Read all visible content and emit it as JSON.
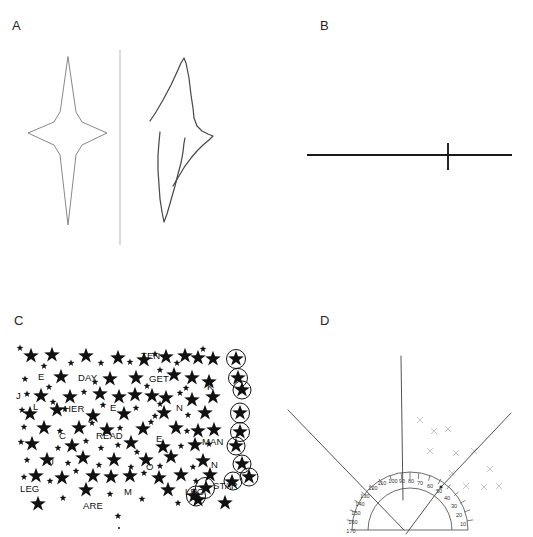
{
  "figure": {
    "background_color": "#ffffff",
    "ink_color": "#1a1a1a",
    "faint_ink_color": "#b9b9b9"
  },
  "panels": {
    "a": {
      "label": "A",
      "name": "figure-copying-task",
      "description": "Star figure copying task: model star at left of a vertical divider, patient copy at right with left side omitted",
      "divider": {
        "x": 120,
        "y_top": 50,
        "y_bottom": 245
      },
      "model_star": {
        "points": [
          [
            68,
            57
          ],
          [
            76,
            112
          ],
          [
            82,
            122
          ],
          [
            107,
            133
          ],
          [
            82,
            145
          ],
          [
            76,
            155
          ],
          [
            68,
            225
          ],
          [
            60,
            155
          ],
          [
            54,
            145
          ],
          [
            28,
            133
          ],
          [
            54,
            122
          ],
          [
            60,
            112
          ]
        ]
      },
      "copy_star": {
        "upper_stroke": [
          [
            150,
            121
          ],
          [
            156,
            112
          ],
          [
            163,
            100
          ],
          [
            171,
            85
          ],
          [
            177,
            72
          ],
          [
            181,
            63
          ],
          [
            184,
            58
          ],
          [
            186,
            63
          ],
          [
            189,
            78
          ],
          [
            191,
            95
          ],
          [
            193,
            108
          ],
          [
            194,
            118
          ],
          [
            197,
            126
          ],
          [
            202,
            131
          ],
          [
            208,
            134
          ],
          [
            213,
            136
          ],
          [
            209,
            140
          ],
          [
            203,
            145
          ],
          [
            197,
            151
          ],
          [
            191,
            158
          ],
          [
            185,
            166
          ],
          [
            179,
            176
          ],
          [
            173,
            186
          ]
        ],
        "lower_stroke": [
          [
            160,
            132
          ],
          [
            159,
            142
          ],
          [
            158,
            155
          ],
          [
            158,
            170
          ],
          [
            159,
            185
          ],
          [
            160,
            199
          ],
          [
            162,
            212
          ],
          [
            164,
            222
          ],
          [
            167,
            214
          ],
          [
            171,
            200
          ],
          [
            175,
            186
          ],
          [
            178,
            174
          ],
          [
            181,
            163
          ],
          [
            183,
            152
          ],
          [
            184,
            143
          ],
          [
            185,
            138
          ]
        ]
      }
    },
    "b": {
      "label": "B",
      "name": "line-bisection-task",
      "description": "Line bisection task: horizontal line with the patient's bisection mark displaced to the right of true midpoint",
      "line": {
        "x_start": 307,
        "x_end": 512,
        "y": 155
      },
      "true_midpoint_x": 409.5,
      "bisection_mark": {
        "x": 448,
        "y_top": 143,
        "y_bottom": 170
      }
    },
    "c": {
      "label": "C",
      "name": "star-cancellation-task",
      "description": "Star cancellation test: field of large and small stars interspersed with letters and words; the patient has circled only targets on the right side of the page",
      "words": [
        {
          "text": "TEN",
          "x": 141,
          "y": 354
        },
        {
          "text": "E",
          "x": 38,
          "y": 375
        },
        {
          "text": "DAY",
          "x": 78,
          "y": 376
        },
        {
          "text": "GET",
          "x": 149,
          "y": 377
        },
        {
          "text": "K",
          "x": 207,
          "y": 385
        },
        {
          "text": "J",
          "x": 16,
          "y": 394
        },
        {
          "text": "L",
          "x": 33,
          "y": 405
        },
        {
          "text": "HER",
          "x": 64,
          "y": 407
        },
        {
          "text": "E",
          "x": 110,
          "y": 406
        },
        {
          "text": "N",
          "x": 176,
          "y": 406
        },
        {
          "text": "C",
          "x": 59,
          "y": 434
        },
        {
          "text": "READ",
          "x": 96,
          "y": 434
        },
        {
          "text": "E",
          "x": 156,
          "y": 437
        },
        {
          "text": "MAN",
          "x": 202,
          "y": 440
        },
        {
          "text": "U",
          "x": 47,
          "y": 460
        },
        {
          "text": "O",
          "x": 146,
          "y": 465
        },
        {
          "text": "N",
          "x": 211,
          "y": 463
        },
        {
          "text": "LEG",
          "x": 20,
          "y": 487
        },
        {
          "text": "M",
          "x": 124,
          "y": 490
        },
        {
          "text": "LEG",
          "x": 185,
          "y": 490
        },
        {
          "text": "STAR",
          "x": 213,
          "y": 484
        },
        {
          "text": "ARE",
          "x": 83,
          "y": 504
        }
      ],
      "circled_targets_count": 11,
      "circled_targets_side": "right"
    },
    "d": {
      "label": "D",
      "name": "subjective-straight-ahead-task",
      "description": "Protractor-based subjective straight-ahead / pointing task. Radiating lines converge at a vertex displaced to the right; faint x-marks are clustered on the right hemifield",
      "protractor": {
        "center_x": 410,
        "center_y": 530,
        "outer_radius": 58,
        "inner_radius": 42,
        "labels": [
          {
            "value": "10",
            "angle_deg": 10
          },
          {
            "value": "20",
            "angle_deg": 20
          },
          {
            "value": "30",
            "angle_deg": 30
          },
          {
            "value": "40",
            "angle_deg": 40
          },
          {
            "value": "50",
            "angle_deg": 50
          },
          {
            "value": "60",
            "angle_deg": 60
          },
          {
            "value": "70",
            "angle_deg": 70
          },
          {
            "value": "80",
            "angle_deg": 80
          },
          {
            "value": "90",
            "angle_deg": 90
          },
          {
            "value": "100",
            "angle_deg": 100
          },
          {
            "value": "110",
            "angle_deg": 110
          },
          {
            "value": "120",
            "angle_deg": 120
          },
          {
            "value": "130",
            "angle_deg": 130
          },
          {
            "value": "140",
            "angle_deg": 140
          },
          {
            "value": "150",
            "angle_deg": 150
          },
          {
            "value": "160",
            "angle_deg": 160
          },
          {
            "value": "170",
            "angle_deg": 170
          }
        ]
      },
      "rays": [
        {
          "name": "vertical-ray",
          "x1": 401,
          "y1": 356,
          "x2": 403,
          "y2": 500
        },
        {
          "name": "upper-left-ray",
          "x1": 288,
          "y1": 410,
          "x2": 404,
          "y2": 530
        },
        {
          "name": "upper-right-ray",
          "x1": 511,
          "y1": 413,
          "x2": 441,
          "y2": 487
        },
        {
          "name": "lower-ray",
          "x1": 406,
          "y1": 534,
          "x2": 441,
          "y2": 487
        }
      ],
      "faint_marks": [
        {
          "x": 420,
          "y": 421
        },
        {
          "x": 434,
          "y": 432
        },
        {
          "x": 448,
          "y": 430
        },
        {
          "x": 430,
          "y": 452
        },
        {
          "x": 456,
          "y": 454
        },
        {
          "x": 474,
          "y": 452
        },
        {
          "x": 452,
          "y": 474
        },
        {
          "x": 466,
          "y": 487
        },
        {
          "x": 484,
          "y": 488
        },
        {
          "x": 499,
          "y": 487
        },
        {
          "x": 490,
          "y": 470
        }
      ]
    }
  }
}
